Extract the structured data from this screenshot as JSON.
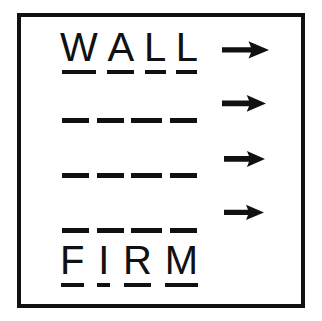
{
  "card": {
    "name": "word-ladder-puzzle-card",
    "background_color": "#ffffff",
    "frame_color": "#111111",
    "ink_color": "#111111"
  },
  "top_word": {
    "text": "WALL",
    "letters": [
      {
        "char": "W",
        "underlined": true
      },
      {
        "char": "A",
        "underlined": true
      },
      {
        "char": "L",
        "underlined": true
      },
      {
        "char": "L",
        "underlined": true
      }
    ]
  },
  "bottom_word": {
    "text": "FIRM",
    "letters": [
      {
        "char": "F",
        "underlined": true
      },
      {
        "char": "I",
        "underlined": true
      },
      {
        "char": "R",
        "underlined": true
      },
      {
        "char": "M",
        "underlined": true
      }
    ]
  },
  "blank_rows": [
    {
      "index": 1,
      "dash_count": 4,
      "label": "blank-word-row-1"
    },
    {
      "index": 2,
      "dash_count": 4,
      "label": "blank-word-row-2"
    },
    {
      "index": 3,
      "dash_count": 4,
      "label": "blank-word-row-3"
    }
  ],
  "arrows": [
    {
      "index": 1,
      "direction": "right",
      "icon": "arrow-right-icon"
    },
    {
      "index": 2,
      "direction": "right",
      "icon": "arrow-right-icon"
    },
    {
      "index": 3,
      "direction": "right",
      "icon": "arrow-right-icon"
    },
    {
      "index": 4,
      "direction": "right",
      "icon": "arrow-right-icon"
    }
  ]
}
